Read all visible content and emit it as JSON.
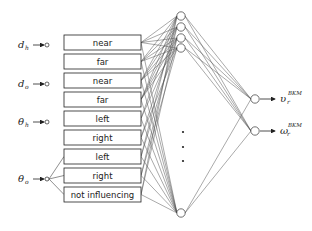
{
  "diagram": {
    "type": "neural-network",
    "inputs": [
      {
        "symbol": "d",
        "subscript": "h",
        "y": 45
      },
      {
        "symbol": "d",
        "subscript": "o",
        "y": 84
      },
      {
        "symbol": "θ",
        "subscript": "h",
        "y": 122
      },
      {
        "symbol": "θ",
        "subscript": "o",
        "y": 179
      }
    ],
    "fuzzy_sets": [
      {
        "label": "near",
        "input": 0
      },
      {
        "label": "far",
        "input": 0
      },
      {
        "label": "near",
        "input": 1
      },
      {
        "label": "far",
        "input": 1
      },
      {
        "label": "left",
        "input": 2
      },
      {
        "label": "right",
        "input": 2
      },
      {
        "label": "left",
        "input": 3
      },
      {
        "label": "right",
        "input": 3
      },
      {
        "label": "not influencing",
        "input": 3
      }
    ],
    "hidden_layer": {
      "visible_nodes": 5,
      "ellipsis": "•\n•\n•"
    },
    "outputs": [
      {
        "symbol": "υ",
        "subscript": "r",
        "superscript": "BKM",
        "y": 99
      },
      {
        "symbol": "ω",
        "subscript": "r",
        "superscript": "BKM",
        "y": 131
      }
    ],
    "colors": {
      "line": "#333333",
      "node_fill": "#ffffff",
      "text": "#222222"
    }
  }
}
